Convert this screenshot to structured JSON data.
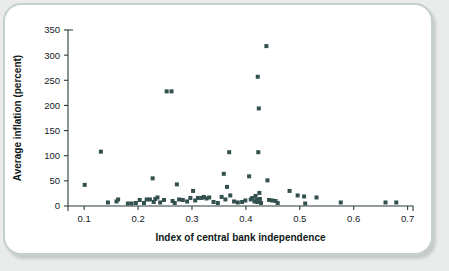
{
  "figure": {
    "frame_color": "#c3d0cf",
    "background_color": "#e9ecea",
    "plot_background": "#ffffff"
  },
  "chart_data": {
    "type": "scatter",
    "title": "",
    "xlabel": "Index of central bank independence",
    "ylabel": "Average inflation (percent)",
    "xlim": [
      0.07,
      0.71
    ],
    "ylim": [
      0,
      350
    ],
    "xticks": [
      0.1,
      0.2,
      0.3,
      0.4,
      0.5,
      0.6,
      0.7
    ],
    "xtick_labels": [
      "0.1",
      "0.2",
      "0.3",
      "0.4",
      "0.5",
      "0.6",
      "0.7"
    ],
    "yticks": [
      0,
      50,
      100,
      150,
      200,
      250,
      300,
      350
    ],
    "ytick_labels": [
      "0",
      "50",
      "100",
      "150",
      "200",
      "250",
      "300",
      "350"
    ],
    "grid": false,
    "legend": false,
    "marker": "square",
    "marker_color": "#32504e",
    "marker_size": 4,
    "points": [
      [
        0.101,
        42
      ],
      [
        0.131,
        108
      ],
      [
        0.144,
        7
      ],
      [
        0.16,
        9
      ],
      [
        0.163,
        13
      ],
      [
        0.181,
        5
      ],
      [
        0.188,
        5
      ],
      [
        0.196,
        6
      ],
      [
        0.203,
        12
      ],
      [
        0.211,
        6
      ],
      [
        0.216,
        13
      ],
      [
        0.222,
        13
      ],
      [
        0.227,
        55
      ],
      [
        0.229,
        8
      ],
      [
        0.232,
        14
      ],
      [
        0.236,
        17
      ],
      [
        0.241,
        7
      ],
      [
        0.248,
        12
      ],
      [
        0.253,
        228
      ],
      [
        0.262,
        228
      ],
      [
        0.264,
        10
      ],
      [
        0.268,
        6
      ],
      [
        0.272,
        43
      ],
      [
        0.276,
        13
      ],
      [
        0.283,
        12
      ],
      [
        0.291,
        9
      ],
      [
        0.297,
        16
      ],
      [
        0.302,
        30
      ],
      [
        0.306,
        11
      ],
      [
        0.311,
        16
      ],
      [
        0.318,
        16
      ],
      [
        0.322,
        18
      ],
      [
        0.327,
        15
      ],
      [
        0.332,
        17
      ],
      [
        0.34,
        8
      ],
      [
        0.348,
        6
      ],
      [
        0.355,
        18
      ],
      [
        0.359,
        64
      ],
      [
        0.362,
        13
      ],
      [
        0.365,
        38
      ],
      [
        0.369,
        107
      ],
      [
        0.371,
        21
      ],
      [
        0.378,
        9
      ],
      [
        0.385,
        7
      ],
      [
        0.393,
        8
      ],
      [
        0.399,
        11
      ],
      [
        0.406,
        59
      ],
      [
        0.409,
        13
      ],
      [
        0.412,
        16
      ],
      [
        0.416,
        9
      ],
      [
        0.418,
        20
      ],
      [
        0.42,
        12
      ],
      [
        0.421,
        8
      ],
      [
        0.422,
        257
      ],
      [
        0.423,
        107
      ],
      [
        0.424,
        194
      ],
      [
        0.425,
        26
      ],
      [
        0.426,
        14
      ],
      [
        0.428,
        6
      ],
      [
        0.438,
        318
      ],
      [
        0.44,
        51
      ],
      [
        0.443,
        12
      ],
      [
        0.449,
        11
      ],
      [
        0.455,
        10
      ],
      [
        0.459,
        6
      ],
      [
        0.481,
        30
      ],
      [
        0.496,
        21
      ],
      [
        0.508,
        19
      ],
      [
        0.51,
        5
      ],
      [
        0.531,
        17
      ],
      [
        0.576,
        7
      ],
      [
        0.659,
        7
      ],
      [
        0.679,
        7
      ]
    ]
  }
}
